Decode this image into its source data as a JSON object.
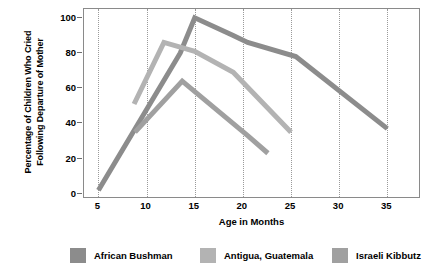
{
  "chart_data": {
    "type": "line",
    "title": "",
    "xlabel": "Age in Months",
    "ylabel_line1": "Percentage of Children Who Cried",
    "ylabel_line2": "Following Departure of Mother",
    "xlim": [
      3.5,
      38.5
    ],
    "ylim": [
      -3,
      105
    ],
    "xticks": [
      5,
      10,
      15,
      20,
      25,
      30,
      35
    ],
    "xticklabels": [
      "5",
      "10",
      "15",
      "20",
      "25",
      "30",
      "35"
    ],
    "yticks": [
      0,
      20,
      40,
      60,
      80,
      100
    ],
    "yticklabels": [
      "0",
      "20",
      "40",
      "60",
      "80",
      "100"
    ],
    "grid": "vertical-dotted",
    "legend_position": "below",
    "series": [
      {
        "name": "African Bushman",
        "color": "#8c8c8c",
        "x": [
          5,
          13.5,
          15,
          19,
          20.5,
          25.5,
          35
        ],
        "y": [
          2,
          80,
          100,
          90,
          86,
          78,
          37
        ]
      },
      {
        "name": "Antigua, Guatemala",
        "color": "#b3b3b3",
        "x": [
          8.7,
          11.8,
          15,
          19,
          25
        ],
        "y": [
          51,
          86,
          81,
          69,
          35
        ]
      },
      {
        "name": "Israeli Kibbutz",
        "color": "#a0a0a0",
        "x": [
          8.8,
          13.7,
          20.5,
          22.6
        ],
        "y": [
          35,
          64,
          33,
          23
        ]
      }
    ]
  },
  "legend": {
    "items": [
      {
        "label": "African Bushman",
        "color": "#8c8c8c"
      },
      {
        "label": "Antigua, Guatemala",
        "color": "#b3b3b3"
      },
      {
        "label": "Israeli Kibbutz",
        "color": "#a0a0a0"
      }
    ]
  }
}
